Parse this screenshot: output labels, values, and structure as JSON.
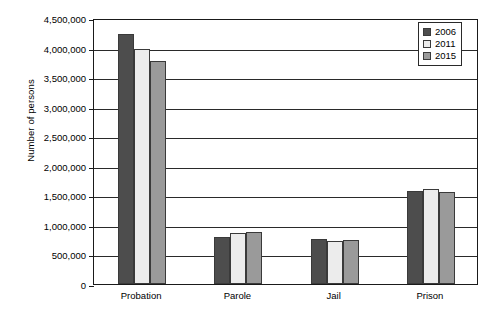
{
  "chart_data": {
    "type": "bar",
    "title": "",
    "xlabel": "",
    "ylabel": "Number of persons",
    "ylim": [
      0,
      4500000
    ],
    "ytick_step": 500000,
    "grid": true,
    "legend_position": "top-right",
    "categories": [
      "Probation",
      "Parole",
      "Jail",
      "Prison"
    ],
    "ytick_labels": [
      "4,500,000",
      "4,000,000",
      "3,500,000",
      "3,000,000",
      "2,500,000",
      "2,000,000",
      "1,500,000",
      "1,000,000",
      "500,000",
      "0"
    ],
    "ytick_values": [
      4500000,
      4000000,
      3500000,
      3000000,
      2500000,
      2000000,
      1500000,
      1000000,
      500000,
      0
    ],
    "series": [
      {
        "name": "2006",
        "color": "#4d4d4d",
        "values": [
          4230000,
          800000,
          770000,
          1580000
        ]
      },
      {
        "name": "2011",
        "color": "#ececec",
        "values": [
          3980000,
          865000,
          735000,
          1615000
        ]
      },
      {
        "name": "2015",
        "color": "#9a9a9a",
        "values": [
          3780000,
          885000,
          745000,
          1550000
        ]
      }
    ]
  },
  "axis": {
    "y_title": "Number of persons"
  },
  "legend": {
    "entries": [
      {
        "label": "2006"
      },
      {
        "label": "2011"
      },
      {
        "label": "2015"
      }
    ]
  }
}
